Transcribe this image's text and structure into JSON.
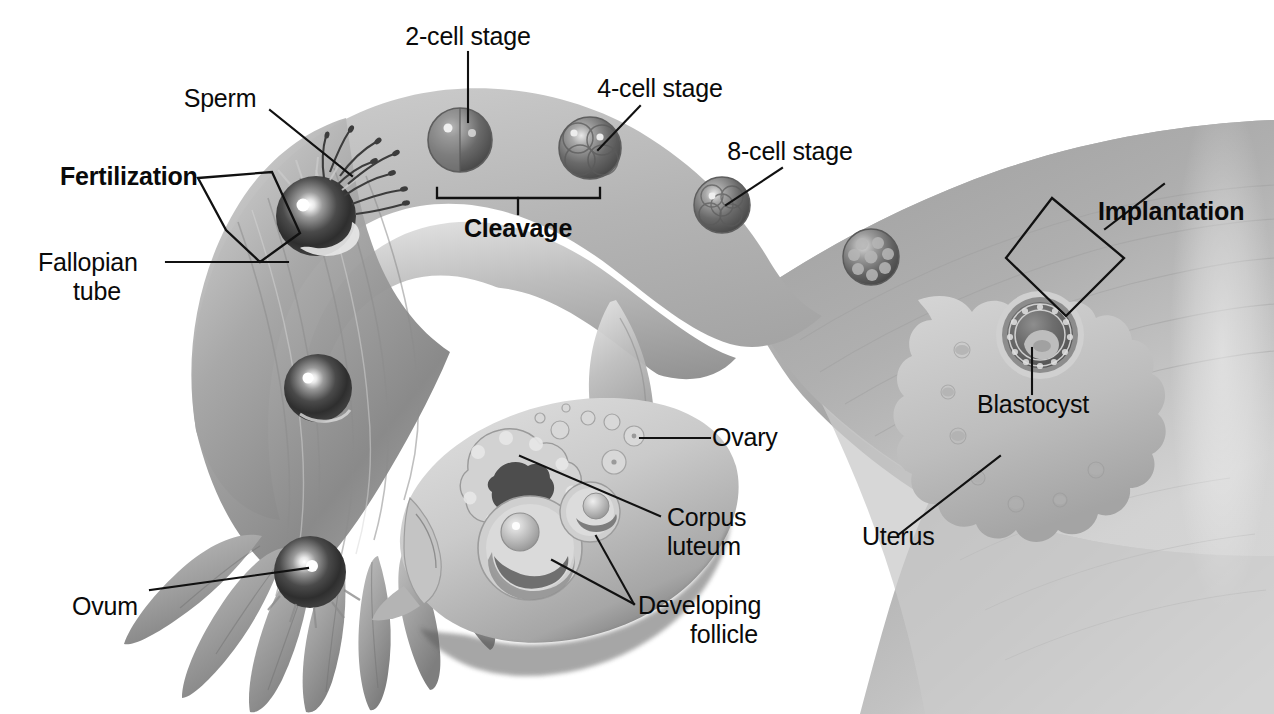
{
  "figure": {
    "type": "anatomical-illustration",
    "style": "grayscale airbrush medical illustration",
    "width": 1274,
    "height": 714,
    "background_color": "#ffffff",
    "label_color": "#0a0a0a",
    "leader_line_color": "#111111"
  },
  "watermarks": {
    "top": "",
    "bottom": ""
  },
  "labels": [
    {
      "id": "sperm",
      "text": "Sperm",
      "bold": false,
      "align": "center"
    },
    {
      "id": "fertilization",
      "text": "Fertilization",
      "bold": true,
      "align": "left"
    },
    {
      "id": "fallopian-tube-1",
      "text": "Fallopian",
      "bold": false,
      "align": "left"
    },
    {
      "id": "fallopian-tube-2",
      "text": "tube",
      "bold": false,
      "align": "center"
    },
    {
      "id": "two-cell-stage",
      "text": "2-cell stage",
      "bold": false,
      "align": "center"
    },
    {
      "id": "four-cell-stage",
      "text": "4-cell stage",
      "bold": false,
      "align": "center"
    },
    {
      "id": "eight-cell-stage",
      "text": "8-cell stage",
      "bold": false,
      "align": "center"
    },
    {
      "id": "cleavage",
      "text": "Cleavage",
      "bold": true,
      "align": "center"
    },
    {
      "id": "implantation",
      "text": "Implantation",
      "bold": true,
      "align": "left"
    },
    {
      "id": "blastocyst",
      "text": "Blastocyst",
      "bold": false,
      "align": "center"
    },
    {
      "id": "uterus",
      "text": "Uterus",
      "bold": false,
      "align": "left"
    },
    {
      "id": "ovary",
      "text": "Ovary",
      "bold": false,
      "align": "left"
    },
    {
      "id": "corpus-luteum-1",
      "text": "Corpus",
      "bold": false,
      "align": "left"
    },
    {
      "id": "corpus-luteum-2",
      "text": "luteum",
      "bold": false,
      "align": "left"
    },
    {
      "id": "developing-follicle-1",
      "text": "Developing",
      "bold": false,
      "align": "left"
    },
    {
      "id": "developing-follicle-2",
      "text": "follicle",
      "bold": false,
      "align": "center"
    },
    {
      "id": "ovum",
      "text": "Ovum",
      "bold": false,
      "align": "left"
    }
  ],
  "structures": [
    {
      "id": "fallopian-tube",
      "name": "Fallopian tube",
      "description": "curved tube sweeping from left fimbriae up and right into the uterus"
    },
    {
      "id": "fimbriae",
      "name": "Fimbriae",
      "description": "finger-like projections at the ovarian end of the fallopian tube"
    },
    {
      "id": "ovary",
      "name": "Ovary",
      "description": "oval organ containing follicles in several stages"
    },
    {
      "id": "corpus-luteum",
      "name": "Corpus luteum",
      "description": "crenated yellow body on the upper-left face of the ovary"
    },
    {
      "id": "developing-follicle",
      "name": "Developing follicle",
      "description": "two ring-shaped maturing follicles inside the ovary"
    },
    {
      "id": "uterus",
      "name": "Uterus",
      "description": "thick muscular wall at the right of the illustration"
    },
    {
      "id": "endometrium",
      "name": "Endometrium",
      "description": "scalloped inner uterine lining where the blastocyst implants"
    },
    {
      "id": "blastocyst",
      "name": "Blastocyst",
      "description": "hollow ball of cells embedded in the endometrium"
    },
    {
      "id": "morula",
      "name": "Morula",
      "description": "unlabeled mulberry-like cell cluster between 8-cell stage and blastocyst"
    }
  ],
  "developmental_sequence": [
    {
      "order": 1,
      "stage": "Ovum",
      "labeled": true
    },
    {
      "order": 2,
      "stage": "Fertilization",
      "labeled": true
    },
    {
      "order": 3,
      "stage": "2-cell stage",
      "labeled": true
    },
    {
      "order": 4,
      "stage": "4-cell stage",
      "labeled": true
    },
    {
      "order": 5,
      "stage": "8-cell stage",
      "labeled": true
    },
    {
      "order": 6,
      "stage": "Morula",
      "labeled": false
    },
    {
      "order": 7,
      "stage": "Blastocyst",
      "labeled": true
    },
    {
      "order": 8,
      "stage": "Implantation",
      "labeled": true
    }
  ],
  "brackets": [
    {
      "id": "cleavage-bracket",
      "spans": "2-cell stage through 4-cell stage",
      "shape": "square-bracket-down"
    },
    {
      "id": "fertilization-bracket",
      "spans": "fertilization site in ampulla",
      "shape": "diamond"
    },
    {
      "id": "implantation-bracket",
      "spans": "implantation site in endometrium",
      "shape": "diamond"
    }
  ]
}
